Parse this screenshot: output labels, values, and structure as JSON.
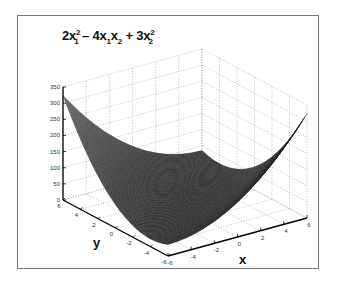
{
  "chart_data": {
    "type": "surface",
    "title_parts": {
      "t1": "2x",
      "s1a": "2",
      "b1a": "1",
      "t2": " – 4x",
      "b2a": "1",
      "t3": "x",
      "b3a": "2",
      "t4": " + 3x",
      "s4a": "2",
      "b4a": "2"
    },
    "function": "z = 2*x^2 - 4*x*y + 3*y^2",
    "xlabel": "x",
    "ylabel": "y",
    "zlabel": "",
    "xlim": [
      -6,
      6
    ],
    "ylim": [
      -6,
      6
    ],
    "zlim": [
      0,
      350
    ],
    "x_ticks": [
      -6,
      -4,
      -2,
      0,
      2,
      4,
      6
    ],
    "y_ticks": [
      -6,
      -4,
      -2,
      0,
      2,
      4,
      6
    ],
    "z_ticks": [
      0,
      50,
      100,
      150,
      200,
      250,
      300,
      350
    ],
    "grid": true,
    "colormap": "gray",
    "sample_values": [
      {
        "x": -6,
        "y": 6,
        "z": 324
      },
      {
        "x": 6,
        "y": 6,
        "z": 36
      },
      {
        "x": -6,
        "y": -6,
        "z": 36
      },
      {
        "x": 6,
        "y": -6,
        "z": 324
      },
      {
        "x": 0,
        "y": 0,
        "z": 0
      }
    ]
  }
}
